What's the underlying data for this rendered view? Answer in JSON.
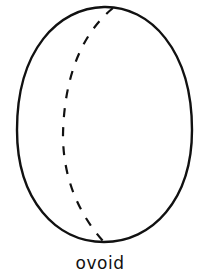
{
  "figure": {
    "label": "ovoid",
    "stroke_color": "#111111",
    "background": "#ffffff"
  }
}
